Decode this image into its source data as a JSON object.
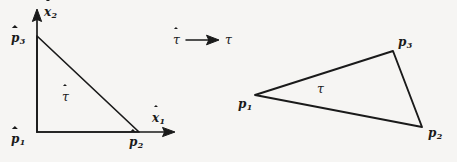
{
  "figure": {
    "background_color": "#f6f5f3",
    "ink_color": "#1a1a1a"
  },
  "left_panel": {
    "name": "reference-triangle",
    "axes": [
      {
        "id": "x1",
        "label_base": "x",
        "label_sub": "1",
        "accent": "hat",
        "direction": "horizontal"
      },
      {
        "id": "x2",
        "label_base": "x",
        "label_sub": "2",
        "accent": "hat",
        "direction": "vertical"
      }
    ],
    "vertices": [
      {
        "id": "p1-hat",
        "label_base": "p",
        "label_sub": "1",
        "accent": "hat",
        "x": 37,
        "y": 132
      },
      {
        "id": "p2-hat",
        "label_base": "p",
        "label_sub": "2",
        "accent": "hat",
        "x": 139,
        "y": 132
      },
      {
        "id": "p3-hat",
        "label_base": "p",
        "label_sub": "3",
        "accent": "hat",
        "x": 37,
        "y": 36
      }
    ],
    "region_label": {
      "id": "tau-hat",
      "text": "τ",
      "accent": "hat"
    }
  },
  "map_arrow": {
    "name": "mapping-arrow",
    "source_label": {
      "text": "τ",
      "accent": "hat"
    },
    "target_label": {
      "text": "τ",
      "accent": "none"
    }
  },
  "right_panel": {
    "name": "physical-triangle",
    "vertices": [
      {
        "id": "p1",
        "label_base": "p",
        "label_sub": "1",
        "accent": "none",
        "x": 255,
        "y": 95
      },
      {
        "id": "p2",
        "label_base": "p",
        "label_sub": "2",
        "accent": "none",
        "x": 422,
        "y": 127
      },
      {
        "id": "p3",
        "label_base": "p",
        "label_sub": "3",
        "accent": "none",
        "x": 393,
        "y": 51
      }
    ],
    "region_label": {
      "id": "tau",
      "text": "τ",
      "accent": "none"
    }
  },
  "labels": {
    "x1_base": "x",
    "x1_sub": "1",
    "x2_base": "x",
    "x2_sub": "2",
    "p1_hat_base": "p",
    "p1_hat_sub": "1",
    "p2_hat_base": "p",
    "p2_hat_sub": "2",
    "p3_hat_base": "p",
    "p3_hat_sub": "3",
    "tau_hat_region": "τ",
    "tau_hat_arrow": "τ",
    "tau_arrow": "τ",
    "p1_base": "p",
    "p1_sub": "1",
    "p2_base": "p",
    "p2_sub": "2",
    "p3_base": "p",
    "p3_sub": "3",
    "tau_region": "τ"
  }
}
